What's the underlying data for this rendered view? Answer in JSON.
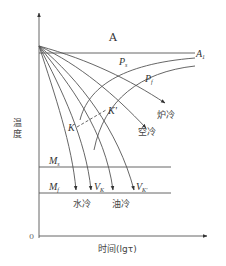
{
  "diagram": {
    "title": "",
    "axes": {
      "y_label": "温度",
      "x_label": "时间(lgτ)",
      "origin": "0"
    },
    "regions": {
      "austenite": "A"
    },
    "lines": {
      "a1": {
        "label": "A",
        "sub": "1"
      },
      "ms": {
        "label": "M",
        "sub": "s"
      },
      "mf": {
        "label": "M",
        "sub": "f"
      }
    },
    "curves": {
      "ps": {
        "label": "P",
        "sub": "s"
      },
      "pf": {
        "label": "P",
        "sub": "f"
      },
      "k": {
        "label": "K"
      },
      "k_prime": {
        "label": "K'"
      }
    },
    "cooling": {
      "furnace": "炉冷",
      "air": "空冷",
      "water": "水冷",
      "oil": "油冷",
      "vk": {
        "label": "V",
        "sub": "K"
      },
      "vk_prime": {
        "label": "V",
        "sub": "K'"
      }
    },
    "colors": {
      "line": "#444444",
      "text": "#333333"
    }
  }
}
